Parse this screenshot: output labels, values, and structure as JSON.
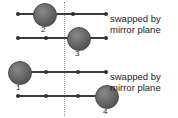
{
  "figure": {
    "mirror_plane": {
      "label": "mirror plane",
      "x": 64,
      "style": "dotted-vertical"
    },
    "colors": {
      "background": "#ffffff",
      "bond": "#3a3a3a",
      "small_atom": "#2e2e2e",
      "big_atom": "#6e6e6e",
      "mirror_line": "#9a9a9a",
      "text": "#1c1c1c"
    },
    "annotations": [
      {
        "id": "note-top",
        "line1": "swapped by",
        "line2": "mirror plane"
      },
      {
        "id": "note-bottom",
        "line1": "swapped by",
        "line2": "mirror plane"
      }
    ],
    "chains": [
      {
        "id": "chain-1",
        "row": 1,
        "y": 14,
        "line_start_x": 18,
        "line_end_x": 106,
        "small_atoms_x": [
          18,
          73,
          106
        ],
        "big_atom": {
          "label": "2",
          "cx": 44,
          "r": 11,
          "label_x": 41,
          "label_y": 26
        }
      },
      {
        "id": "chain-2",
        "row": 2,
        "y": 38,
        "line_start_x": 18,
        "line_end_x": 106,
        "small_atoms_x": [
          18,
          46,
          106
        ],
        "big_atom": {
          "label": "3",
          "cx": 78,
          "r": 11,
          "label_x": 75,
          "label_y": 50
        }
      },
      {
        "id": "chain-3",
        "row": 3,
        "y": 72,
        "line_start_x": 18,
        "line_end_x": 106,
        "small_atoms_x": [
          18,
          46,
          78,
          106
        ],
        "big_atom": {
          "label": "1",
          "cx": 19,
          "r": 11,
          "label_x": 16,
          "label_y": 84
        }
      },
      {
        "id": "chain-4",
        "row": 4,
        "y": 96,
        "line_start_x": 18,
        "line_end_x": 106,
        "small_atoms_x": [
          18,
          46,
          78
        ],
        "big_atom": {
          "label": "4",
          "cx": 106,
          "r": 11,
          "label_x": 103,
          "label_y": 108
        }
      }
    ],
    "note_positions": [
      {
        "id": "note-top",
        "x": 110,
        "y": 13
      },
      {
        "id": "note-bottom",
        "x": 110,
        "y": 71
      }
    ]
  }
}
